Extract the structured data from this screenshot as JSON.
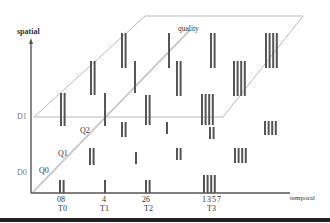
{
  "figure": {
    "axes": {
      "vertical_label": "spatial",
      "horizontal_label": "temporal",
      "diagonal_label": "quality"
    },
    "spatial_levels": [
      {
        "label": "D0",
        "y": 173
      },
      {
        "label": "D1",
        "y": 117
      }
    ],
    "quality_levels": [
      {
        "label": "Q0",
        "x": 39,
        "y": 170
      },
      {
        "label": "Q1",
        "x": 55,
        "y": 153
      },
      {
        "label": "Q2",
        "x": 80,
        "y": 128
      }
    ],
    "temporal_groups": [
      {
        "frames": "08",
        "label": "T0",
        "x": 61
      },
      {
        "frames": "4",
        "label": "T1",
        "x": 104
      },
      {
        "frames": "26",
        "label": "T2",
        "x": 148
      },
      {
        "frames": "1357",
        "label": "T3",
        "x": 213
      }
    ],
    "colors": {
      "bar": "#555555",
      "axis": "#555555",
      "plane": "#aaaaaa",
      "diagonal": "#999999"
    },
    "bar_clusters": [
      {
        "name": "d0-q0-t0",
        "x": 59,
        "y": 180,
        "h": 13,
        "count": 2
      },
      {
        "name": "d0-q0-t1",
        "x": 104,
        "y": 180,
        "h": 13,
        "count": 1
      },
      {
        "name": "d0-q0-t2",
        "x": 145,
        "y": 180,
        "h": 13,
        "count": 2
      },
      {
        "name": "d0-q0-t3",
        "x": 203,
        "y": 175,
        "h": 18,
        "count": 4
      },
      {
        "name": "d0-q1-t0",
        "x": 89,
        "y": 148,
        "h": 17,
        "count": 2
      },
      {
        "name": "d0-q1-t1",
        "x": 135,
        "y": 152,
        "h": 12,
        "count": 1
      },
      {
        "name": "d0-q1-t2",
        "x": 176,
        "y": 148,
        "h": 12,
        "count": 2
      },
      {
        "name": "d0-q1-t3",
        "x": 234,
        "y": 148,
        "h": 15,
        "count": 4
      },
      {
        "name": "d0-q2-t0",
        "x": 121,
        "y": 122,
        "h": 15,
        "count": 2
      },
      {
        "name": "d0-q2-t1",
        "x": 166,
        "y": 122,
        "h": 12,
        "count": 1
      },
      {
        "name": "d0-q2-t2",
        "x": 209,
        "y": 127,
        "h": 12,
        "count": 2
      },
      {
        "name": "d0-q2-t3",
        "x": 264,
        "y": 121,
        "h": 14,
        "count": 4
      },
      {
        "name": "d1-q0-t0",
        "x": 60,
        "y": 93,
        "h": 33,
        "count": 2
      },
      {
        "name": "d1-q0-t1",
        "x": 104,
        "y": 93,
        "h": 33,
        "count": 1
      },
      {
        "name": "d1-q0-t2",
        "x": 145,
        "y": 95,
        "h": 30,
        "count": 2
      },
      {
        "name": "d1-q0-t3",
        "x": 201,
        "y": 94,
        "h": 31,
        "count": 4
      },
      {
        "name": "d1-q1-t0",
        "x": 90,
        "y": 61,
        "h": 34,
        "count": 2
      },
      {
        "name": "d1-q1-t1",
        "x": 134,
        "y": 61,
        "h": 32,
        "count": 1
      },
      {
        "name": "d1-q1-t2",
        "x": 176,
        "y": 61,
        "h": 35,
        "count": 2
      },
      {
        "name": "d1-q1-t3",
        "x": 233,
        "y": 61,
        "h": 35,
        "count": 4
      },
      {
        "name": "d1-q2-t0",
        "x": 121,
        "y": 33,
        "h": 35,
        "count": 2
      },
      {
        "name": "d1-q2-t1",
        "x": 168,
        "y": 33,
        "h": 35,
        "count": 1
      },
      {
        "name": "d1-q2-t2",
        "x": 210,
        "y": 33,
        "h": 35,
        "count": 2
      },
      {
        "name": "d1-q2-t3",
        "x": 265,
        "y": 33,
        "h": 35,
        "count": 4
      }
    ]
  }
}
